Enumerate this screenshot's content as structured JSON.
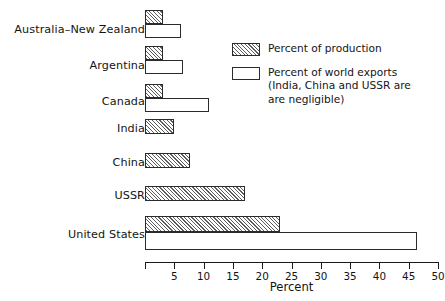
{
  "chart_data": {
    "type": "bar",
    "orientation": "horizontal",
    "title": "",
    "xlabel": "Percent",
    "ylabel": "",
    "xlim": [
      0,
      50
    ],
    "xticks": [
      0,
      5,
      10,
      15,
      20,
      25,
      30,
      35,
      40,
      45,
      50
    ],
    "xtick_labels": [
      "",
      "5",
      "10",
      "15",
      "20",
      "25",
      "30",
      "35",
      "40",
      "45",
      "50"
    ],
    "grid": false,
    "legend_position": "upper right",
    "categories": [
      "Australia–New Zealand",
      "Argentina",
      "Canada",
      "India",
      "China",
      "USSR",
      "United States"
    ],
    "series": [
      {
        "name": "Percent of production",
        "style": "hatched",
        "values": [
          3.0,
          3.0,
          3.0,
          5.0,
          7.7,
          17.0,
          23.0
        ]
      },
      {
        "name": "Percent of world exports",
        "style": "open",
        "values": [
          6.2,
          6.5,
          11.0,
          0,
          0,
          0,
          46.5
        ]
      }
    ],
    "annotations": [
      "India, China and USSR are are negligible"
    ]
  },
  "axis": {
    "title": "Percent",
    "tick_labels": [
      "",
      "5",
      "10",
      "15",
      "20",
      "25",
      "30",
      "35",
      "40",
      "45",
      "50"
    ]
  },
  "categories": [
    {
      "label": "Australia–New Zealand"
    },
    {
      "label": "Argentina"
    },
    {
      "label": "Canada"
    },
    {
      "label": "India"
    },
    {
      "label": "China"
    },
    {
      "label": "USSR"
    },
    {
      "label": "United States"
    }
  ],
  "legend": {
    "items": [
      {
        "swatch": "hatched",
        "text": "Percent of production"
      },
      {
        "swatch": "open",
        "text": "Percent of world exports\n(India, China and USSR are\nare negligible)"
      }
    ]
  }
}
